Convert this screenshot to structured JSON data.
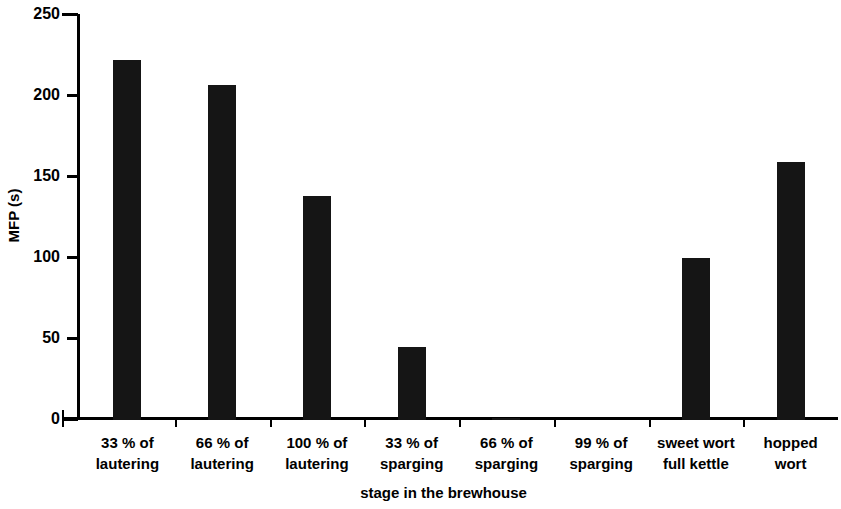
{
  "chart_data": {
    "type": "bar",
    "title": "",
    "subtitle": "",
    "xlabel": "stage in the brewhouse",
    "ylabel": "MFP (s)",
    "categories": [
      "33 % of\nlautering",
      "66 % of\nlautering",
      "100 % of\nlautering",
      "33 % of\nsparging",
      "66 % of\nsparging",
      "99 % of\nsparging",
      "sweet wort\nfull kettle",
      "hopped\nwort"
    ],
    "values": [
      222,
      207,
      138,
      45,
      1,
      0,
      100,
      159
    ],
    "ylim": [
      0,
      250
    ],
    "yticks": [
      0,
      50,
      100,
      150,
      200,
      250
    ],
    "ytick_labels": [
      "0",
      "50",
      "100",
      "150",
      "200",
      "250"
    ],
    "xlim_categories": 8,
    "grid": false,
    "legend": false,
    "legend_position": "none",
    "bar_color": "#151515",
    "axis_color": "#000000",
    "background_color": "#ffffff"
  }
}
